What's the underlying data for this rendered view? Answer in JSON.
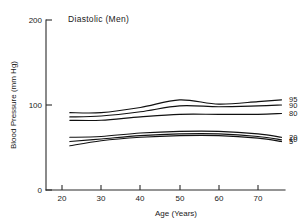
{
  "chart_data": {
    "type": "line",
    "title": "Diastolic (Men)",
    "xlabel": "Age (Years)",
    "ylabel": "Blood Pressure (mm Hg)",
    "xlim": [
      20,
      76
    ],
    "ylim": [
      0,
      200
    ],
    "xticks": [
      20,
      30,
      40,
      50,
      60,
      70
    ],
    "yticks": [
      0,
      100,
      200
    ],
    "grid": false,
    "legend_position": "right-inline",
    "x": [
      22,
      30,
      40,
      50,
      60,
      70,
      76
    ],
    "series": [
      {
        "name": "95",
        "label": "95",
        "values": [
          91,
          91,
          97,
          106,
          101,
          104,
          106
        ]
      },
      {
        "name": "90",
        "label": "90",
        "values": [
          86,
          87,
          92,
          99,
          98,
          99,
          100
        ]
      },
      {
        "name": "80",
        "label": "80",
        "values": [
          82,
          82,
          86,
          89,
          89,
          89,
          90
        ]
      },
      {
        "name": "20",
        "label": "20",
        "values": [
          62,
          63,
          67,
          69,
          69,
          66,
          62
        ]
      },
      {
        "name": "10",
        "label": "10",
        "values": [
          57,
          60,
          64,
          66,
          66,
          63,
          59
        ]
      },
      {
        "name": "5",
        "label": "5",
        "values": [
          52,
          58,
          62,
          64,
          64,
          61,
          57
        ]
      }
    ]
  },
  "axis": {
    "y_tick_0": "0",
    "y_tick_100": "100",
    "y_tick_200": "200",
    "x_tick_20": "20",
    "x_tick_30": "30",
    "x_tick_40": "40",
    "x_tick_50": "50",
    "x_tick_60": "60",
    "x_tick_70": "70"
  },
  "legend": {
    "p95": "95",
    "p90": "90",
    "p80": "80",
    "p20": "20",
    "p10": "10",
    "p5": "5"
  },
  "colors": {
    "line": "#111111",
    "axis": "#2a2a2a",
    "background": "#ffffff"
  }
}
